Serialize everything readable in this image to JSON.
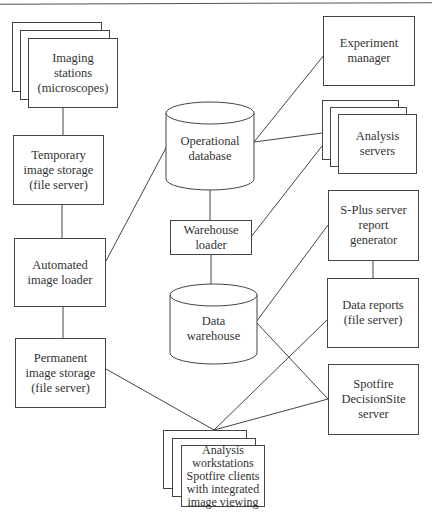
{
  "diagram": {
    "nodes": {
      "imaging_stations": {
        "label": "Imaging\nstations\n(microscopes)",
        "shape": "stacked-rect"
      },
      "temporary_storage": {
        "label": "Temporary\nimage storage\n(file server)",
        "shape": "rect"
      },
      "automated_loader": {
        "label": "Automated\nimage loader",
        "shape": "rect"
      },
      "permanent_storage": {
        "label": "Permanent\nimage storage\n(file server)",
        "shape": "rect"
      },
      "operational_db": {
        "label": "Operational\ndatabase",
        "shape": "cylinder"
      },
      "warehouse_loader": {
        "label": "Warehouse\nloader",
        "shape": "rect"
      },
      "data_warehouse": {
        "label": "Data\nwarehouse",
        "shape": "cylinder"
      },
      "experiment_manager": {
        "label": "Experiment\nmanager",
        "shape": "rect"
      },
      "analysis_servers": {
        "label": "Analysis\nservers",
        "shape": "stacked-rect"
      },
      "splus_server": {
        "label": "S-Plus server\nreport\ngenerator",
        "shape": "rect"
      },
      "data_reports": {
        "label": "Data reports\n(file server)",
        "shape": "rect"
      },
      "spotfire_server": {
        "label": "Spotfire\nDecisionSite\nserver",
        "shape": "rect"
      },
      "analysis_workstations": {
        "label": "Analysis\nworkstations\nSpotfire clients\nwith integrated\nimage viewing",
        "shape": "stacked-rect"
      }
    },
    "edges": [
      [
        "imaging_stations",
        "temporary_storage"
      ],
      [
        "temporary_storage",
        "automated_loader"
      ],
      [
        "automated_loader",
        "permanent_storage"
      ],
      [
        "automated_loader",
        "operational_db"
      ],
      [
        "operational_db",
        "experiment_manager"
      ],
      [
        "operational_db",
        "analysis_servers"
      ],
      [
        "operational_db",
        "warehouse_loader"
      ],
      [
        "warehouse_loader",
        "analysis_servers"
      ],
      [
        "warehouse_loader",
        "data_warehouse"
      ],
      [
        "data_warehouse",
        "splus_server"
      ],
      [
        "data_warehouse",
        "spotfire_server"
      ],
      [
        "splus_server",
        "data_reports"
      ],
      [
        "data_reports",
        "analysis_workstations"
      ],
      [
        "spotfire_server",
        "analysis_workstations"
      ],
      [
        "permanent_storage",
        "analysis_workstations"
      ]
    ],
    "colors": {
      "stroke": "#444444",
      "fill": "#ffffff",
      "text": "#333333"
    }
  }
}
